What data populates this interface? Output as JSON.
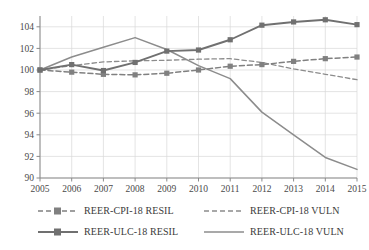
{
  "chart_data": {
    "type": "line",
    "title": "",
    "xlabel": "",
    "ylabel": "",
    "categories": [
      "2005",
      "2006",
      "2007",
      "2008",
      "2009",
      "2010",
      "2011",
      "2012",
      "2013",
      "2014",
      "2015"
    ],
    "x": [
      2005,
      2006,
      2007,
      2008,
      2009,
      2010,
      2011,
      2012,
      2013,
      2014,
      2015
    ],
    "ylim": [
      90,
      105
    ],
    "yticks": [
      90,
      92,
      94,
      96,
      98,
      100,
      102,
      104
    ],
    "grid": true,
    "legend_position": "bottom",
    "series": [
      {
        "name": "REER-CPI-18 RESIL",
        "style": "dashed",
        "markers": true,
        "color": "#808080",
        "values": [
          100.0,
          99.8,
          99.6,
          99.55,
          99.7,
          100.0,
          100.35,
          100.5,
          100.8,
          101.05,
          101.2
        ]
      },
      {
        "name": "REER-CPI-18 VULN",
        "style": "dashed",
        "markers": false,
        "color": "#8c8c8c",
        "values": [
          100.0,
          100.4,
          100.75,
          100.85,
          100.9,
          101.0,
          101.05,
          100.7,
          100.1,
          99.6,
          99.1
        ]
      },
      {
        "name": "REER-ULC-18 RESIL",
        "style": "solid",
        "markers": true,
        "color": "#707070",
        "values": [
          100.0,
          100.5,
          99.95,
          100.7,
          101.75,
          101.85,
          102.8,
          104.15,
          104.45,
          104.65,
          104.2
        ]
      },
      {
        "name": "REER-ULC-18 VULN",
        "style": "solid",
        "markers": false,
        "color": "#8c8c8c",
        "values": [
          100.0,
          101.2,
          102.1,
          103.0,
          101.9,
          100.4,
          99.2,
          96.1,
          94.0,
          91.9,
          90.8
        ]
      }
    ]
  },
  "legend": {
    "entries": [
      {
        "label": "REER-CPI-18 RESIL",
        "series_index": 0
      },
      {
        "label": "REER-CPI-18 VULN",
        "series_index": 1
      },
      {
        "label": "REER-ULC-18 RESIL",
        "series_index": 2
      },
      {
        "label": "REER-ULC-18 VULN",
        "series_index": 3
      }
    ]
  },
  "axis": {
    "y_tick_labels": [
      "104",
      "102",
      "100",
      "98",
      "96",
      "94",
      "92",
      "90"
    ],
    "x_tick_labels": [
      "2005",
      "2006",
      "2007",
      "2008",
      "2009",
      "2010",
      "2011",
      "2012",
      "2013",
      "2014",
      "2015"
    ]
  }
}
